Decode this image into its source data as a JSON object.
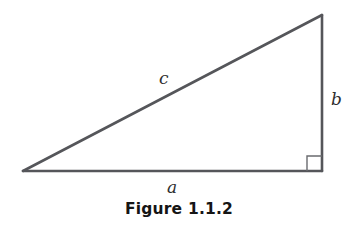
{
  "figure": {
    "caption": "Figure 1.1.2",
    "background_color": "#ffffff",
    "stroke_color": "#55565a",
    "label_color": "#2e2e2e",
    "caption_color": "#151515",
    "geometry": {
      "left_vertex": {
        "x": 23,
        "y": 171
      },
      "right_angle_vertex": {
        "x": 322,
        "y": 171
      },
      "top_vertex": {
        "x": 322,
        "y": 15
      },
      "stroke_width": 2.6,
      "right_angle_marker": {
        "size": 15,
        "stroke_width": 1.4,
        "x": 307,
        "y": 156
      }
    },
    "labels": {
      "hypotenuse": "c",
      "vertical_leg": "b",
      "horizontal_leg": "a"
    }
  }
}
